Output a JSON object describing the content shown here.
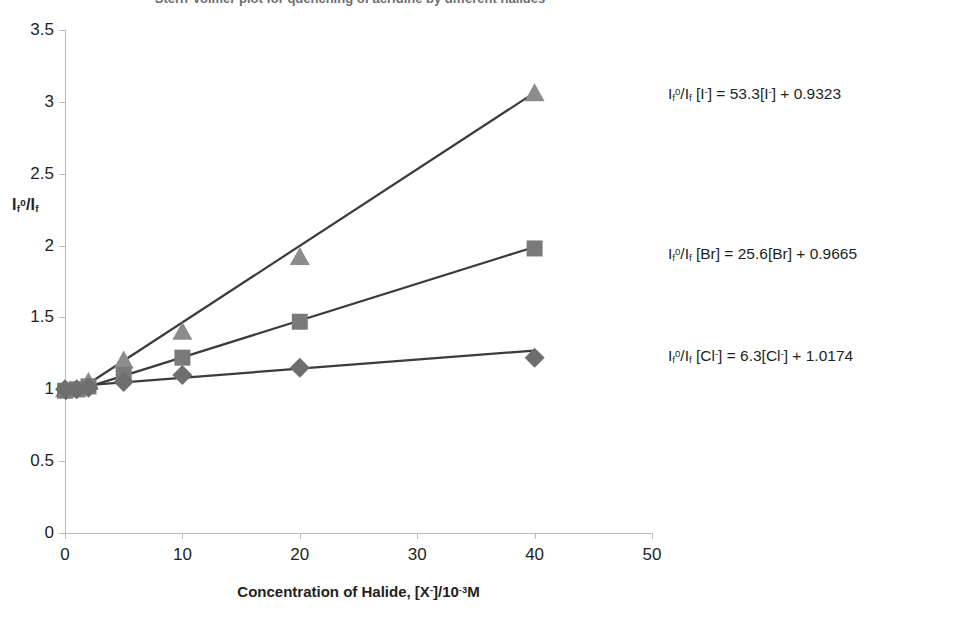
{
  "chart_data": {
    "type": "scatter",
    "title": "Stern-Volmer plot for quenching of acridine by different halides",
    "xlabel": "Concentration of Halide, [X⁻]/10⁻³M",
    "ylabel": "Iₖ⁰/Iₖ",
    "ylabel_parts": {
      "pre": "I",
      "sub1": "f",
      "sup": "0",
      "mid": "/I",
      "sub2": "f"
    },
    "xlim": [
      0,
      50
    ],
    "ylim": [
      0,
      3.5
    ],
    "xticks": [
      "0",
      "10",
      "20",
      "30",
      "40",
      "50"
    ],
    "xtick_values": [
      0,
      10,
      20,
      30,
      40,
      50
    ],
    "yticks": [
      "0",
      "0.5",
      "1",
      "1.5",
      "2",
      "2.5",
      "3",
      "3.5"
    ],
    "ytick_values": [
      0,
      0.5,
      1,
      1.5,
      2,
      2.5,
      3,
      3.5
    ],
    "grid": false,
    "legend_position": "none",
    "series": [
      {
        "name": "Iodide",
        "ion": "I⁻",
        "marker": "triangle",
        "marker_color": "#8c8c8c",
        "line_color": "#3b3b3b",
        "x": [
          0,
          1,
          2,
          5,
          10,
          20,
          40
        ],
        "y": [
          1.0,
          1.0,
          1.05,
          1.2,
          1.4,
          1.92,
          3.06
        ],
        "slope": 53.3,
        "intercept": 0.9323,
        "equation": "Iₖ⁰/Iₖ [I⁻] = 53.3[I⁻] + 0.9323",
        "equation_parts": {
          "lead": "I",
          "sub1": "f",
          "sup": "0",
          "mid": "/I",
          "sub2": "f",
          "rest_a": " [I",
          "ionsup": "-",
          "rest_b": "] = 53.3[I",
          "ionsup2": "-",
          "rest_c": "] + 0.9323"
        }
      },
      {
        "name": "Bromide",
        "ion": "Br",
        "marker": "square",
        "marker_color": "#7a7a7a",
        "line_color": "#3b3b3b",
        "x": [
          0,
          1,
          2,
          5,
          10,
          20,
          40
        ],
        "y": [
          0.99,
          1.0,
          1.02,
          1.1,
          1.22,
          1.47,
          1.98
        ],
        "slope": 25.6,
        "intercept": 0.9665,
        "equation": "Iₖ⁰/Iₖ [Br] = 25.6[Br] + 0.9665",
        "equation_parts": {
          "lead": "I",
          "sub1": "f",
          "sup": "0",
          "mid": "/I",
          "sub2": "f",
          "rest_a": " [Br",
          "ionsup": "",
          "rest_b": "] = 25.6[Br",
          "ionsup2": "",
          "rest_c": "] + 0.9665"
        }
      },
      {
        "name": "Chloride",
        "ion": "Cl⁻",
        "marker": "diamond",
        "marker_color": "#6e6e6e",
        "line_color": "#3b3b3b",
        "x": [
          0,
          1,
          2,
          5,
          10,
          20,
          40
        ],
        "y": [
          1.0,
          1.0,
          1.01,
          1.05,
          1.1,
          1.15,
          1.22
        ],
        "slope": 6.3,
        "intercept": 1.0174,
        "equation": "Iₖ⁰/Iₖ [Cl⁻] = 6.3[Cl⁻] + 1.0174",
        "equation_parts": {
          "lead": "I",
          "sub1": "f",
          "sup": "0",
          "mid": "/I",
          "sub2": "f",
          "rest_a": " [Cl",
          "ionsup": "-",
          "rest_b": "] = 6.3[Cl",
          "ionsup2": "-",
          "rest_c": "] + 1.0174"
        }
      }
    ],
    "trendlines": [
      {
        "name": "Iodide fit",
        "x0": 0,
        "y0": 0.9323,
        "x1": 40,
        "y1": 3.0643
      },
      {
        "name": "Bromide fit",
        "x0": 0,
        "y0": 0.9665,
        "x1": 40,
        "y1": 1.9905
      },
      {
        "name": "Chloride fit",
        "x0": 0,
        "y0": 1.0174,
        "x1": 40,
        "y1": 1.2694
      }
    ],
    "colors": {
      "axis": "#b9babc",
      "text": "#231f20",
      "title": "#6d6e71",
      "line": "#3b3b3b",
      "marker": "#8c8c8c"
    }
  }
}
